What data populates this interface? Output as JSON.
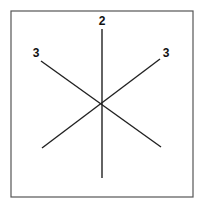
{
  "diagram": {
    "frame": {
      "x1": 11,
      "y1": 11,
      "x2": 193,
      "y2": 197,
      "stroke": "#555555"
    },
    "center": {
      "x": 102,
      "y": 103
    },
    "lines": [
      {
        "name": "vertical-line",
        "x1": 102,
        "y1": 29,
        "x2": 102,
        "y2": 178
      },
      {
        "name": "diagonal-line-1",
        "x1": 41,
        "y1": 61,
        "x2": 161,
        "y2": 147
      },
      {
        "name": "diagonal-line-2",
        "x1": 160,
        "y1": 59,
        "x2": 42,
        "y2": 148
      }
    ],
    "labels": [
      {
        "name": "label-top",
        "text": "2",
        "x": 102,
        "y": 25
      },
      {
        "name": "label-upper-left",
        "text": "3",
        "x": 36,
        "y": 57
      },
      {
        "name": "label-upper-right",
        "text": "3",
        "x": 166,
        "y": 57
      }
    ],
    "line_color": "#222222"
  }
}
